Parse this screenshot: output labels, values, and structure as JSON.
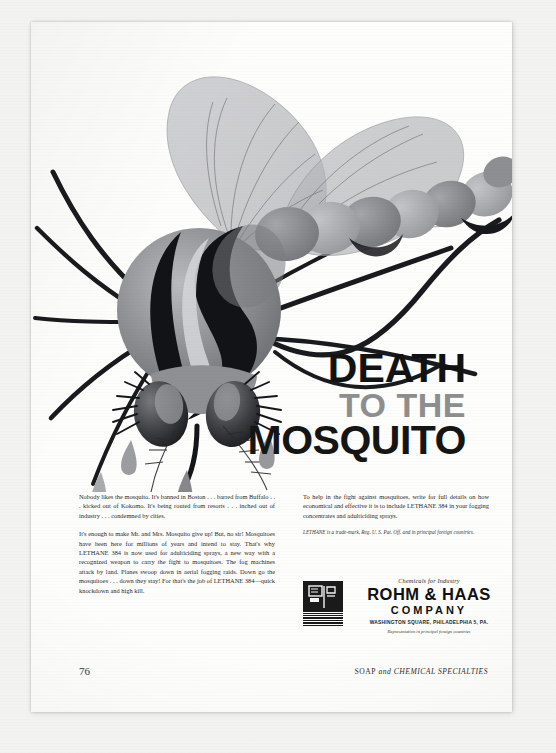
{
  "publication": {
    "page_number": "76",
    "journal_name_part1": "SOAP",
    "journal_name_and": "and",
    "journal_name_part2": "CHEMICAL SPECIALTIES"
  },
  "headline": {
    "line1": "DEATH",
    "line2": "TO THE",
    "line3": "MOSQUITO",
    "color_line1": "#121212",
    "color_line2": "#8e8e8e",
    "color_line3": "#151515"
  },
  "body_copy": {
    "left_column": [
      "Nobody likes the mosquito. It's banned in Boston . . . barred from Buffalo . . . kicked out of Kokomo. It's being routed from resorts . . . inched out of industry . . . condemned by cities.",
      "It's enough to make Mr. and Mrs. Mosquito give up! But, no sir! Mosquitoes have been here for millions of years and intend to stay. That's why LETHANE 384 is now used for adulticiding sprays, a new way with a recognized weapon to carry the fight to mosquitoes. The fog machines attack by land. Planes swoop down in aerial fogging raids. Down go the mosquitoes . . . down they stay! For that's the job of LETHANE 384—quick knockdown and high kill."
    ],
    "right_column": [
      "To help in the fight against mosquitoes, write for full details on how economical and effective it is to include LETHANE 384 in your fogging concentrates and adulticiding sprays."
    ],
    "legal_note": "LETHANE is a trade-mark, Reg. U. S. Pat. Off. and in principal foreign countries."
  },
  "advertiser": {
    "tagline": "Chemicals for Industry",
    "name_line1": "ROHM & HAAS",
    "name_line2": "COMPANY",
    "address": "WASHINGTON SQUARE, PHILADELPHIA 5, PA.",
    "representation": "Representation in principal foreign countries",
    "logo_name": "rohm-and-haas-monogram"
  },
  "illustration": {
    "subject": "mosquito",
    "description": "Stylized mid-century mosquito with translucent veined wings, segmented oval abdomen, striped thorax, large lashed eyes and falling teardrops",
    "palette": {
      "ink_black": "#16161a",
      "dark_gray": "#595a5e",
      "mid_gray": "#86888c",
      "light_gray": "#aeb0b3",
      "pale_gray": "#c9cbcd",
      "wing_gray": "#b9bbbe",
      "paper": "#fdfdfc"
    }
  }
}
